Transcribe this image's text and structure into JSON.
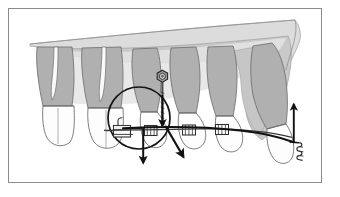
{
  "figure": {
    "title": "Orthodontic biomechanics diagram: maxillary arch with mini-implant anchorage",
    "canvas": {
      "width": 340,
      "height": 197
    },
    "background_color": "#ffffff",
    "border": {
      "color": "#8c8c8c",
      "width_px": 1,
      "inset": {
        "left": 8,
        "top": 8,
        "right": 8,
        "bottom": 12
      }
    },
    "palette": {
      "root_fill": "#b0b0b0",
      "crown_fill": "#fdfdfd",
      "bone_fill": "#c9c9c9",
      "bone_light_fill": "#e2e2e2",
      "outline": "#6b6b6b",
      "appliance_stroke": "#3a3a3a",
      "force_vector": "#111111",
      "implant_fill": "#9a9a9a"
    },
    "elements": {
      "bone_label": "alveolar bone and palate outline",
      "teeth_label": "maxillary teeth, sagittal view",
      "implant_label": "mini-implant screw head",
      "molar_tube_label": "molar tube appliance",
      "archwire_label": "archwire",
      "elastic_label": "retraction elastic chain",
      "circle_label": "center of resistance circle",
      "hook_label": "anterior hook / coil",
      "brackets_label": "brackets"
    },
    "teeth": [
      {
        "name": "second-molar",
        "crown_x": 55,
        "type": "molar",
        "roots": 2
      },
      {
        "name": "first-molar",
        "crown_x": 100,
        "type": "molar",
        "roots": 2
      },
      {
        "name": "second-premolar",
        "crown_x": 145,
        "type": "premolar",
        "roots": 1
      },
      {
        "name": "first-premolar",
        "crown_x": 180,
        "type": "premolar",
        "roots": 1
      },
      {
        "name": "canine",
        "crown_x": 215,
        "type": "canine",
        "roots": 1
      },
      {
        "name": "incisor",
        "crown_x": 270,
        "type": "incisor",
        "roots": 1
      }
    ],
    "force_vectors": [
      {
        "name": "intrusion-vector-premolar",
        "direction": "down",
        "x": 143,
        "y_start": 126,
        "y_end": 166
      },
      {
        "name": "distal-tipping-vector",
        "direction": "down-right",
        "x_start": 165,
        "y_start": 126,
        "x_end": 184,
        "y_end": 160
      },
      {
        "name": "anterior-intrusion-vector",
        "direction": "up",
        "x": 294,
        "y_start": 140,
        "y_end": 103
      },
      {
        "name": "implant-axial-vector",
        "direction": "down",
        "x": 163,
        "y_start": 95,
        "y_end": 130
      }
    ],
    "annotation_count": 4
  }
}
